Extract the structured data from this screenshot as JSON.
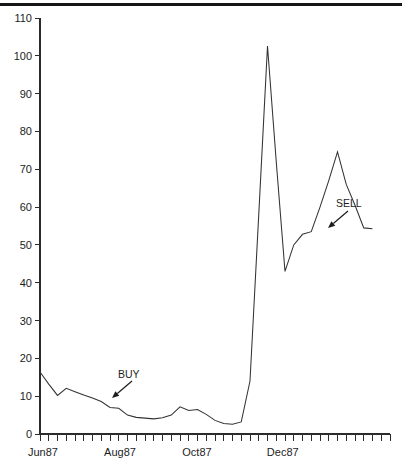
{
  "chart_data": {
    "type": "line",
    "title": "",
    "subtitle": "",
    "xlabel": "",
    "ylabel": "",
    "grid": false,
    "legend": false,
    "ylim": [
      0,
      110
    ],
    "y_ticks": [
      0,
      10,
      20,
      30,
      40,
      50,
      60,
      70,
      80,
      90,
      100,
      110
    ],
    "y_tick_labels": [
      "0",
      "10",
      "20",
      "30",
      "40",
      "50",
      "60",
      "70",
      "80",
      "90",
      "100",
      "110"
    ],
    "x_tick_count": 40,
    "x_tick_labels": [
      "Jun87",
      "Aug87",
      "Oct87",
      "Dec87"
    ],
    "x_tick_label_positions": [
      0,
      8.8,
      17.6,
      27.4
    ],
    "x_axis_note": "weekly minor ticks, month labels every ~9 ticks",
    "series": [
      {
        "name": "price",
        "x": [
          0,
          1,
          2,
          3,
          4,
          5,
          6,
          7,
          8,
          9,
          10,
          11,
          12,
          13,
          14,
          15,
          16,
          17,
          18,
          19,
          20,
          21,
          22,
          23,
          24,
          25,
          26,
          27,
          28,
          29,
          30,
          31,
          32,
          33,
          34,
          35,
          36,
          37,
          38
        ],
        "values": [
          16.4,
          13.2,
          10.2,
          12.1,
          11.2,
          10.3,
          9.5,
          8.6,
          7.0,
          6.8,
          5.0,
          4.4,
          4.2,
          4.0,
          4.3,
          5.0,
          7.2,
          6.2,
          6.5,
          5.2,
          3.6,
          2.8,
          2.6,
          3.2,
          14.0,
          58.0,
          102.6,
          72.0,
          43.0,
          50.0,
          52.8,
          53.5,
          60.0,
          67.0,
          74.6,
          66.0,
          60.5,
          54.5,
          54.3
        ]
      }
    ],
    "annotations": [
      {
        "label": "BUY",
        "label_x": 118,
        "label_y": 378,
        "arrow_from_x": 132,
        "arrow_from_y": 381,
        "arrow_to_x": 112,
        "arrow_to_y": 398
      },
      {
        "label": "SELL",
        "label_x": 336,
        "label_y": 207,
        "arrow_from_x": 348,
        "arrow_from_y": 211,
        "arrow_to_x": 328,
        "arrow_to_y": 228
      }
    ]
  },
  "axes": {
    "plot_left": 40,
    "plot_right": 390,
    "plot_top": 18,
    "plot_bottom": 434
  }
}
